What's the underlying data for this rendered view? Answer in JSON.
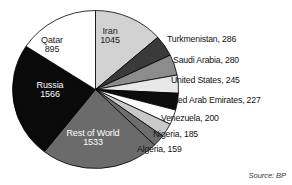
{
  "source": {
    "label": "Source: BP"
  },
  "colors": {
    "qatar": "#d2d2d2",
    "turkmenistan": "#3a3a3a",
    "saudi_arabia": "#8c8c8c",
    "united_states": "#e8e8e8",
    "united_arab_emirates": "#0d0d0d",
    "venezuela": "#ffffff",
    "nigeria": "#c9c9c9",
    "algeria": "#6e6e6e",
    "rest_of_world": "#6b6b6b",
    "russia": "#0a0a0a",
    "iran": "#ffffff",
    "outline": "#000000",
    "background": "#ffffff",
    "text_dark": "#111111",
    "text_light": "#ffffff"
  },
  "inner_labels": [
    {
      "name": "Qatar",
      "value": "895",
      "value_num": 895
    },
    {
      "name": "Iran",
      "value": "1045",
      "value_num": 1045
    },
    {
      "name": "Russia",
      "value": "1566",
      "value_num": 1566
    },
    {
      "name": "Rest of World",
      "value": "1533",
      "value_num": 1533
    }
  ],
  "callouts": [
    {
      "text": "Turkmenistan, 286"
    },
    {
      "text": "Saudi Arabia, 280"
    },
    {
      "text": "United States, 245"
    },
    {
      "text": "United Arab Emirates, 227"
    },
    {
      "text": "Venezuela, 200"
    },
    {
      "text": "Nigeria, 185"
    },
    {
      "text": "Algeria, 159"
    }
  ],
  "chart_data": {
    "type": "pie",
    "title": "",
    "subtitle": "",
    "xlabel": "",
    "ylabel": "",
    "legend_position": "callout-right",
    "grid": false,
    "start_angle_deg": 0,
    "direction": "clockwise",
    "units": "trillion cubic feet",
    "categories": [
      "Qatar",
      "Turkmenistan",
      "Saudi Arabia",
      "United States",
      "United Arab Emirates",
      "Venezuela",
      "Nigeria",
      "Algeria",
      "Rest of World",
      "Russia",
      "Iran"
    ],
    "values": [
      895,
      286,
      280,
      245,
      227,
      200,
      185,
      159,
      1533,
      1566,
      1045
    ],
    "total": 6621,
    "slices": [
      {
        "label": "Qatar",
        "value": 895,
        "color": "#d2d2d2",
        "label_placement": "inside"
      },
      {
        "label": "Turkmenistan",
        "value": 286,
        "color": "#3a3a3a",
        "label_placement": "callout"
      },
      {
        "label": "Saudi Arabia",
        "value": 280,
        "color": "#8c8c8c",
        "label_placement": "callout"
      },
      {
        "label": "United States",
        "value": 245,
        "color": "#e8e8e8",
        "label_placement": "callout"
      },
      {
        "label": "United Arab Emirates",
        "value": 227,
        "color": "#0d0d0d",
        "label_placement": "callout"
      },
      {
        "label": "Venezuela",
        "value": 200,
        "color": "#ffffff",
        "label_placement": "callout"
      },
      {
        "label": "Nigeria",
        "value": 185,
        "color": "#c9c9c9",
        "label_placement": "callout"
      },
      {
        "label": "Algeria",
        "value": 159,
        "color": "#6e6e6e",
        "label_placement": "callout"
      },
      {
        "label": "Rest of World",
        "value": 1533,
        "color": "#6b6b6b",
        "label_placement": "inside"
      },
      {
        "label": "Russia",
        "value": 1566,
        "color": "#0a0a0a",
        "label_placement": "inside"
      },
      {
        "label": "Iran",
        "value": 1045,
        "color": "#ffffff",
        "label_placement": "inside"
      }
    ],
    "source": "Source: BP"
  }
}
